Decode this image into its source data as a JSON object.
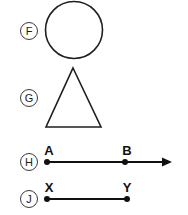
{
  "page": {
    "width": 188,
    "height": 215,
    "background_color": "#ffffff",
    "ink_color": "#111111",
    "badge_stroke_color": "#3a3a3a"
  },
  "figures": [
    {
      "badge": "F",
      "shape_kind": "circle",
      "badge_center": {
        "cx": 29,
        "cy": 31,
        "r": 8.5
      },
      "geometry": {
        "cx": 74,
        "cy": 30,
        "r": 28.5
      }
    },
    {
      "badge": "G",
      "shape_kind": "triangle",
      "badge_center": {
        "cx": 29,
        "cy": 98,
        "r": 8.5
      },
      "geometry": {
        "points": "73,68 101,127 46,127"
      }
    },
    {
      "badge": "H",
      "shape_kind": "ray",
      "badge_center": {
        "cx": 29,
        "cy": 162,
        "r": 8.5
      },
      "geometry": {
        "y": 162,
        "x_start": 47,
        "x_end": 172,
        "arrow_tip_x": 172,
        "arrow_back_x": 163,
        "arrow_half_height": 4.5
      },
      "points": [
        {
          "label": "A",
          "x": 47,
          "y": 162,
          "label_x": 44,
          "label_y": 153
        },
        {
          "label": "B",
          "x": 125,
          "y": 162,
          "label_x": 122,
          "label_y": 153
        }
      ]
    },
    {
      "badge": "J",
      "shape_kind": "segment",
      "badge_center": {
        "cx": 29,
        "cy": 199,
        "r": 8.5
      },
      "geometry": {
        "y": 199,
        "x_start": 47,
        "x_end": 127
      },
      "points": [
        {
          "label": "X",
          "x": 47,
          "y": 199,
          "label_x": 44,
          "label_y": 190
        },
        {
          "label": "Y",
          "x": 127,
          "y": 199,
          "label_x": 122,
          "label_y": 190
        }
      ]
    }
  ],
  "dot_radius": 3
}
